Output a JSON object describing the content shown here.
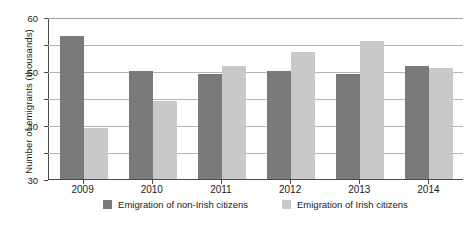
{
  "chart_data": {
    "type": "bar",
    "title": "",
    "subtitle": "",
    "xlabel": "",
    "ylabel": "Number of emigrants (thousands)",
    "categories": [
      "2009",
      "2010",
      "2011",
      "2012",
      "2013",
      "2014"
    ],
    "series": [
      {
        "name": "Emigration of non-Irish citizens",
        "color": "#7a7a7a",
        "values": [
          53,
          40,
          39,
          40,
          39,
          42
        ]
      },
      {
        "name": "Emigration of Irish citizens",
        "color": "#c9c9c9",
        "values": [
          19,
          29,
          42,
          47,
          51,
          41
        ]
      }
    ],
    "ylim": [
      0,
      60
    ],
    "yticks": [
      0,
      10,
      20,
      30,
      40,
      50,
      60
    ],
    "ytick_labels": [
      "0",
      "10",
      "20",
      "30",
      "40",
      "50",
      "60"
    ],
    "grid": true,
    "grid_axis": "y",
    "legend_position": "bottom"
  }
}
